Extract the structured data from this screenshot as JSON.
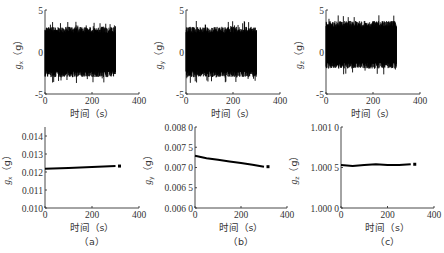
{
  "figure": {
    "panels": [
      "(a)",
      "(b)",
      "(c)"
    ],
    "x_label": "时间（s）"
  },
  "chart_data": [
    {
      "type": "line",
      "panel": "a-top",
      "title": "",
      "xlabel": "时间（s）",
      "ylabel": "g_x（g）",
      "xlim": [
        0,
        400
      ],
      "ylim": [
        -5,
        5
      ],
      "xticks": [
        0,
        200,
        400
      ],
      "yticks": [
        -5,
        0,
        5
      ],
      "series": [
        {
          "name": "g_x raw",
          "x_range": [
            0,
            300
          ],
          "amplitude_upper": 3,
          "amplitude_lower": -3,
          "noise": true
        }
      ],
      "grid": false
    },
    {
      "type": "line",
      "panel": "b-top",
      "title": "",
      "xlabel": "时间（s）",
      "ylabel": "g_y（g）",
      "xlim": [
        0,
        400
      ],
      "ylim": [
        -5,
        5
      ],
      "xticks": [
        0,
        200,
        400
      ],
      "yticks": [
        -5,
        0,
        5
      ],
      "series": [
        {
          "name": "g_y raw",
          "x_range": [
            0,
            300
          ],
          "amplitude_upper": 3,
          "amplitude_lower": -3,
          "noise": true
        }
      ],
      "grid": false
    },
    {
      "type": "line",
      "panel": "c-top",
      "title": "",
      "xlabel": "时间（s）",
      "ylabel": "g_z（g）",
      "xlim": [
        0,
        400
      ],
      "ylim": [
        -5,
        5
      ],
      "xticks": [
        0,
        200,
        400
      ],
      "yticks": [
        -5,
        0,
        5
      ],
      "series": [
        {
          "name": "g_z raw",
          "x_range": [
            0,
            300
          ],
          "amplitude_upper": 3.7,
          "amplitude_lower": -2,
          "noise": true
        }
      ],
      "grid": false
    },
    {
      "type": "line",
      "panel": "a-bottom",
      "title": "",
      "xlabel": "时间（s）",
      "ylabel": "g_x（g）",
      "caption": "（a）",
      "xlim": [
        0,
        400
      ],
      "ylim": [
        0.01,
        0.0145
      ],
      "xticks": [
        0,
        200,
        400
      ],
      "yticks": [
        0.01,
        0.011,
        0.012,
        0.013,
        0.014
      ],
      "ytick_labels": [
        "0.010",
        "0.011",
        "0.012",
        "0.013",
        "0.014"
      ],
      "series": [
        {
          "name": "g_x mean",
          "x": [
            0,
            100,
            200,
            300
          ],
          "y": [
            0.01218,
            0.01222,
            0.01228,
            0.01233
          ]
        }
      ],
      "grid": false
    },
    {
      "type": "line",
      "panel": "b-bottom",
      "title": "",
      "xlabel": "时间（s）",
      "ylabel": "g_y（g）",
      "caption": "（b）",
      "xlim": [
        0,
        400
      ],
      "ylim": [
        0.006,
        0.008
      ],
      "xticks": [
        0,
        200,
        400
      ],
      "yticks": [
        0.006,
        0.0065,
        0.007,
        0.0075,
        0.008
      ],
      "ytick_labels": [
        "0.006 0",
        "0.006 5",
        "0.007 0",
        "0.007 5",
        "0.008 0"
      ],
      "series": [
        {
          "name": "g_y mean",
          "x": [
            0,
            50,
            100,
            150,
            200,
            250,
            300
          ],
          "y": [
            0.00729,
            0.00723,
            0.00719,
            0.00715,
            0.00711,
            0.00707,
            0.00702
          ]
        }
      ],
      "grid": false
    },
    {
      "type": "line",
      "panel": "c-bottom",
      "title": "",
      "xlabel": "时间（s）",
      "ylabel": "g_z（g）",
      "caption": "（c）",
      "xlim": [
        0,
        400
      ],
      "ylim": [
        1.0,
        1.001
      ],
      "xticks": [
        0,
        200,
        400
      ],
      "yticks": [
        1.0,
        1.0005,
        1.001
      ],
      "ytick_labels": [
        "1.000 0",
        "1.000 5",
        "1.001 0"
      ],
      "series": [
        {
          "name": "g_z mean",
          "x": [
            0,
            50,
            100,
            150,
            200,
            250,
            300
          ],
          "y": [
            1.00053,
            1.00052,
            1.00053,
            1.00054,
            1.00053,
            1.00053,
            1.00054
          ]
        }
      ],
      "grid": false
    }
  ]
}
